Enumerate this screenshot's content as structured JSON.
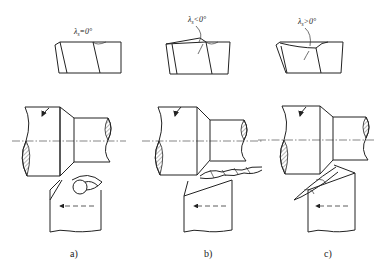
{
  "figure": {
    "panels": [
      {
        "id": "a",
        "label": "a)",
        "angle_label": "λs=0°",
        "angle_symbol": "λ",
        "angle_sub": "s",
        "angle_rel": "=0°"
      },
      {
        "id": "b",
        "label": "b)",
        "angle_label": "λs<0°",
        "angle_symbol": "λ",
        "angle_sub": "s",
        "angle_rel": "<0°"
      },
      {
        "id": "c",
        "label": "c)",
        "angle_label": "λs>0°",
        "angle_symbol": "λ",
        "angle_sub": "s",
        "angle_rel": ">0°"
      }
    ],
    "colors": {
      "line": "#222222",
      "background": "#ffffff"
    }
  }
}
